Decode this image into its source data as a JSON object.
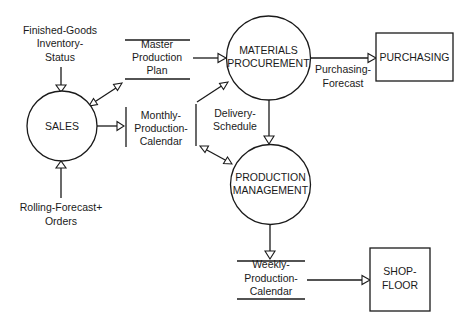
{
  "diagram": {
    "type": "data-flow-diagram",
    "processes": [
      {
        "id": "sales",
        "label": "SALES"
      },
      {
        "id": "materials",
        "label_lines": [
          "MATERIALS",
          "PROCUREMENT"
        ]
      },
      {
        "id": "production",
        "label_lines": [
          "PRODUCTION",
          "MANAGEMENT"
        ]
      }
    ],
    "external_entities": [
      {
        "id": "purchasing",
        "label": "PURCHASING"
      },
      {
        "id": "shopfloor",
        "label_lines": [
          "SHOP-",
          "FLOOR"
        ]
      }
    ],
    "data_stores": [
      {
        "id": "master_plan",
        "label_lines": [
          "Master",
          "Production",
          "Plan"
        ]
      },
      {
        "id": "monthly_calendar",
        "label_lines": [
          "Monthly-",
          "Production-",
          "Calendar"
        ]
      },
      {
        "id": "weekly_calendar",
        "label_lines": [
          "Weekly-",
          "Production-",
          "Calendar"
        ]
      }
    ],
    "flow_labels": {
      "inventory": [
        "Finished-Goods",
        "Inventory-",
        "Status"
      ],
      "rolling": [
        "Rolling-Forecast+",
        "Orders"
      ],
      "purchasing_forecast": [
        "Purchasing-",
        "Forecast"
      ],
      "delivery_schedule": [
        "Delivery-",
        "Schedule"
      ]
    },
    "flows": [
      {
        "from": "Finished-Goods Inventory-Status",
        "to": "SALES"
      },
      {
        "from": "Rolling-Forecast+ Orders",
        "to": "SALES"
      },
      {
        "from": "SALES",
        "to": "Master Production Plan",
        "bidirectional": true
      },
      {
        "from": "SALES",
        "to": "Monthly-Production-Calendar"
      },
      {
        "from": "Master Production Plan",
        "to": "MATERIALS PROCUREMENT"
      },
      {
        "from": "Monthly-Production-Calendar",
        "to": "MATERIALS PROCUREMENT",
        "label": "Delivery-Schedule"
      },
      {
        "from": "Monthly-Production-Calendar",
        "to": "PRODUCTION MANAGEMENT",
        "bidirectional": true
      },
      {
        "from": "MATERIALS PROCUREMENT",
        "to": "PURCHASING",
        "label": "Purchasing-Forecast"
      },
      {
        "from": "MATERIALS PROCUREMENT",
        "to": "PRODUCTION MANAGEMENT"
      },
      {
        "from": "PRODUCTION MANAGEMENT",
        "to": "Weekly-Production-Calendar"
      },
      {
        "from": "Weekly-Production-Calendar",
        "to": "SHOP-FLOOR"
      }
    ]
  }
}
